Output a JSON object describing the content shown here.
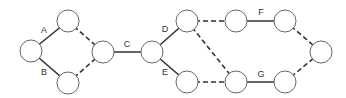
{
  "diagram": {
    "type": "activity-network",
    "nodes": [
      {
        "id": "n1",
        "x": 31,
        "y": 51
      },
      {
        "id": "n2",
        "x": 68,
        "y": 21
      },
      {
        "id": "n3",
        "x": 68,
        "y": 83
      },
      {
        "id": "n4",
        "x": 103,
        "y": 52
      },
      {
        "id": "n5",
        "x": 152,
        "y": 52
      },
      {
        "id": "n6",
        "x": 187,
        "y": 21
      },
      {
        "id": "n7",
        "x": 187,
        "y": 82
      },
      {
        "id": "n8",
        "x": 236,
        "y": 21
      },
      {
        "id": "n9",
        "x": 285,
        "y": 21
      },
      {
        "id": "n10",
        "x": 236,
        "y": 82
      },
      {
        "id": "n11",
        "x": 285,
        "y": 82
      },
      {
        "id": "n12",
        "x": 321,
        "y": 52
      }
    ],
    "edges": [
      {
        "from": "n1",
        "to": "n2",
        "style": "solid",
        "label": "A"
      },
      {
        "from": "n1",
        "to": "n3",
        "style": "solid",
        "label": "B"
      },
      {
        "from": "n2",
        "to": "n4",
        "style": "dashed",
        "label": ""
      },
      {
        "from": "n3",
        "to": "n4",
        "style": "dashed",
        "label": ""
      },
      {
        "from": "n4",
        "to": "n5",
        "style": "solid",
        "label": "C"
      },
      {
        "from": "n5",
        "to": "n6",
        "style": "solid",
        "label": "D"
      },
      {
        "from": "n5",
        "to": "n7",
        "style": "solid",
        "label": "E"
      },
      {
        "from": "n6",
        "to": "n8",
        "style": "dashed",
        "label": ""
      },
      {
        "from": "n6",
        "to": "n10",
        "style": "dashed",
        "label": ""
      },
      {
        "from": "n7",
        "to": "n10",
        "style": "dashed",
        "label": ""
      },
      {
        "from": "n8",
        "to": "n9",
        "style": "solid",
        "label": "F"
      },
      {
        "from": "n10",
        "to": "n11",
        "style": "solid",
        "label": "G"
      },
      {
        "from": "n9",
        "to": "n12",
        "style": "dashed",
        "label": ""
      },
      {
        "from": "n11",
        "to": "n12",
        "style": "dashed",
        "label": ""
      }
    ],
    "labels": {
      "a": "A",
      "b": "B",
      "c": "C",
      "d": "D",
      "e": "E",
      "f": "F",
      "g": "G"
    },
    "colors": {
      "edge": "#333333",
      "node_stroke": "#666666",
      "node_fill": "#ffffff"
    }
  }
}
